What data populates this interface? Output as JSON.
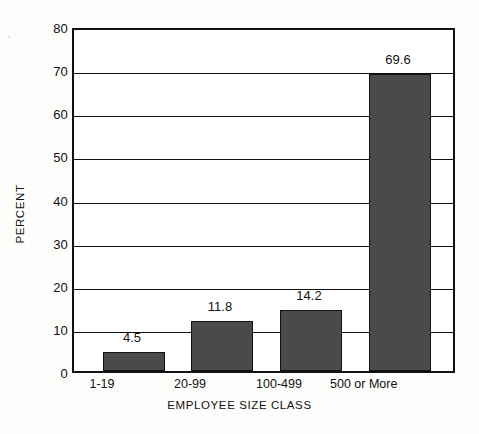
{
  "chart_data": {
    "type": "bar",
    "title": "",
    "xlabel": "EMPLOYEE SIZE CLASS",
    "ylabel": "PERCENT",
    "categories": [
      "1-19",
      "20-99",
      "100-499",
      "500 or More"
    ],
    "values": [
      4.5,
      11.8,
      14.2,
      69.6
    ],
    "value_labels": [
      "4.5",
      "11.8",
      "14.2",
      "69.6"
    ],
    "ylim": [
      0,
      80
    ],
    "ytick_labels": [
      "0",
      "10",
      "20",
      "30",
      "40",
      "50",
      "60",
      "70",
      "80"
    ],
    "ytick_values": [
      0,
      10,
      20,
      30,
      40,
      50,
      60,
      70,
      80
    ],
    "grid": true,
    "legend": "none",
    "series": [
      {
        "name": "Percent",
        "values": [
          4.5,
          11.8,
          14.2,
          69.6
        ]
      }
    ],
    "colors": {
      "bar_fill": "#4a4a4a",
      "bar_stroke": "#111111",
      "gridline": "#111111",
      "axis": "#111111",
      "plot_background": "#ffffff",
      "page_background": "#fdfdfc",
      "text": "#111111"
    }
  }
}
